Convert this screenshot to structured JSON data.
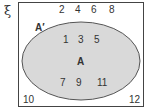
{
  "universal_symbol": "ξ",
  "set_label": "A",
  "complement_label": "A′",
  "outside": [
    "2",
    "4",
    "6",
    "8"
  ],
  "outside_bottom": [
    "10",
    "12"
  ],
  "inside_top": [
    "1",
    "3",
    "5"
  ],
  "inside_bottom": [
    "7",
    "9",
    "11"
  ],
  "colors": {
    "ellipse_fill": "#d9d9d9",
    "ellipse_stroke": "#555555",
    "border": "#444444"
  }
}
